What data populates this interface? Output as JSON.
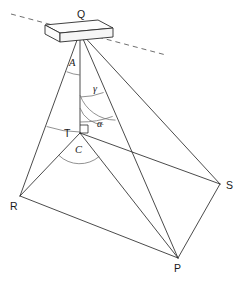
{
  "figure": {
    "type": "geometry-diagram",
    "title": "",
    "background_color": "#ffffff",
    "line_color": "#2b2b2b",
    "arc_color": "#6d6d6d",
    "width": 244,
    "height": 285
  },
  "vertices": [
    {
      "id": "Q",
      "label": "Q",
      "x": 80,
      "y": 32,
      "label_x": 77,
      "label_y": 18,
      "role": "apex"
    },
    {
      "id": "T",
      "label": "T",
      "x": 80,
      "y": 133,
      "label_x": 64,
      "label_y": 137,
      "role": "foot-of-perpendicular"
    },
    {
      "id": "R",
      "label": "R",
      "x": 20,
      "y": 196,
      "label_x": 10,
      "label_y": 210,
      "role": "base-corner"
    },
    {
      "id": "S",
      "label": "S",
      "x": 220,
      "y": 184,
      "label_x": 226,
      "label_y": 189,
      "role": "base-corner"
    },
    {
      "id": "P",
      "label": "P",
      "x": 178,
      "y": 258,
      "label_x": 174,
      "label_y": 272,
      "role": "base-corner"
    }
  ],
  "angles": [
    {
      "id": "A",
      "label": "A",
      "at": "Q",
      "between": "QR and QT",
      "label_x": 69,
      "label_y": 66
    },
    {
      "id": "gamma",
      "label": "γ",
      "at": "Q",
      "between": "QT and QP",
      "label_x": 93,
      "label_y": 92
    },
    {
      "id": "alpha",
      "label": "α",
      "at": "T",
      "between": "TQ and TS",
      "label_x": 97,
      "label_y": 127
    },
    {
      "id": "C",
      "label": "C",
      "at": "T",
      "between": "TR and TP",
      "label_x": 75,
      "label_y": 153
    }
  ],
  "markers": [
    {
      "id": "right-angle-T",
      "type": "right-angle",
      "at": "T",
      "note": "QT perpendicular to base plane"
    }
  ],
  "edges": [
    {
      "from": "Q",
      "to": "R"
    },
    {
      "from": "Q",
      "to": "T"
    },
    {
      "from": "Q",
      "to": "P"
    },
    {
      "from": "Q",
      "to": "S"
    },
    {
      "from": "T",
      "to": "R"
    },
    {
      "from": "T",
      "to": "S"
    },
    {
      "from": "T",
      "to": "P"
    },
    {
      "from": "R",
      "to": "P"
    },
    {
      "from": "P",
      "to": "S"
    }
  ],
  "horizon_line": {
    "id": "horizon",
    "style": "dashed",
    "x1": 11,
    "y1": 14,
    "x2": 166,
    "y2": 55
  },
  "top_object": {
    "id": "beam",
    "shape": "rectangular-box",
    "description": "horizontal rectangular beam at apex Q"
  }
}
